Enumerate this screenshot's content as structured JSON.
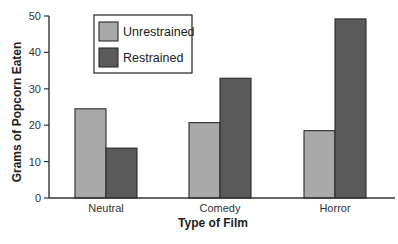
{
  "chart_data": {
    "type": "bar",
    "title": "",
    "xlabel": "Type of Film",
    "ylabel": "Grams of Popcorn Eaten",
    "categories": [
      "Neutral",
      "Comedy",
      "Horror"
    ],
    "series": [
      {
        "name": "Unrestrained",
        "color": "#a9a9a9",
        "values": [
          24.5,
          20.7,
          18.5
        ]
      },
      {
        "name": "Restrained",
        "color": "#5a5a5a",
        "values": [
          13.7,
          32.9,
          49.2
        ]
      }
    ],
    "ylim": [
      0,
      50
    ],
    "yticks": [
      0,
      10,
      20,
      30,
      40,
      50
    ],
    "grid": false,
    "legend_position": "upper-left-inside"
  }
}
